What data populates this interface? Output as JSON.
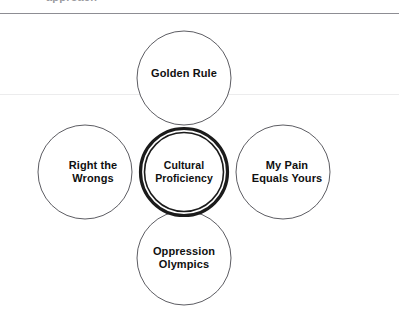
{
  "page": {
    "width": 399,
    "height": 323,
    "background": "#ffffff",
    "clipped_header_text": "approach",
    "rule_color": "#8d8d93",
    "faint_rule_color": "#ececed"
  },
  "diagram": {
    "type": "hub-and-spoke-venn",
    "hub": {
      "label": "Cultural\nProficiency",
      "cx": 184,
      "cy": 172,
      "r": 44,
      "stroke": "#1b1b1b",
      "fill": "#ffffff",
      "double_ring": true
    },
    "petals": [
      {
        "name": "golden-rule",
        "label": "Golden Rule",
        "position": "top",
        "cx": 184,
        "cy": 78,
        "r": 47,
        "label_x": 184,
        "label_y": 74,
        "stroke": "#5d5d63",
        "fill": "#ffffff"
      },
      {
        "name": "my-pain-equals-yours",
        "label": "My Pain\nEquals Yours",
        "position": "right",
        "cx": 283,
        "cy": 172,
        "r": 47,
        "label_x": 287,
        "label_y": 172,
        "stroke": "#5d5d63",
        "fill": "#ffffff"
      },
      {
        "name": "oppression-olympics",
        "label": "Oppression\nOlympics",
        "position": "bottom",
        "cx": 184,
        "cy": 258,
        "r": 47,
        "label_x": 184,
        "label_y": 258,
        "stroke": "#5d5d63",
        "fill": "#ffffff"
      },
      {
        "name": "right-the-wrongs",
        "label": "Right the\nWrongs",
        "position": "left",
        "cx": 85,
        "cy": 172,
        "r": 47,
        "label_x": 93,
        "label_y": 172,
        "stroke": "#5d5d63",
        "fill": "#ffffff"
      }
    ]
  }
}
